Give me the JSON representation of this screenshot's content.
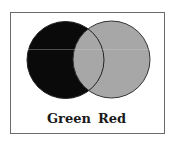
{
  "diagram": {
    "type": "venn",
    "sets": [
      {
        "name": "Green",
        "fill": "#0a0a0a"
      },
      {
        "name": "Red",
        "fill": "#a7a7a7"
      }
    ],
    "labels": {
      "left": "Green",
      "right": "Red"
    },
    "colors": {
      "frame": "#6a6a6a",
      "outline": "#333333",
      "background": "#ffffff"
    }
  }
}
